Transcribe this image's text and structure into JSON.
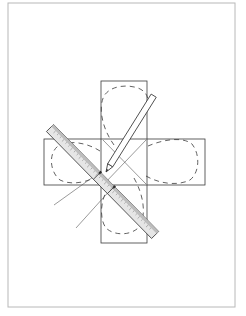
{
  "diagram": {
    "colors": {
      "frame": "#b8b8b8",
      "line": "#3a3a3a",
      "dash": "#3a3a3a",
      "ruler_fill": "#e6e6e6",
      "ruler_edge": "#9a9a9a",
      "pencil_fill": "#ffffff",
      "guide": "#555555"
    },
    "elements": {
      "frame": {
        "x": 8,
        "y": 3,
        "w": 227,
        "h": 304
      },
      "vertical_rect": {
        "x": 101,
        "y": 81,
        "w": 46,
        "h": 162
      },
      "horizontal_rect": {
        "x": 44,
        "y": 139,
        "w": 161,
        "h": 46
      },
      "ruler": {
        "from": [
          50,
          128
        ],
        "to": [
          155,
          235
        ],
        "width": 10
      },
      "pencil": {
        "tip": [
          106,
          172
        ],
        "end": [
          153,
          96
        ],
        "width": 6
      }
    }
  }
}
